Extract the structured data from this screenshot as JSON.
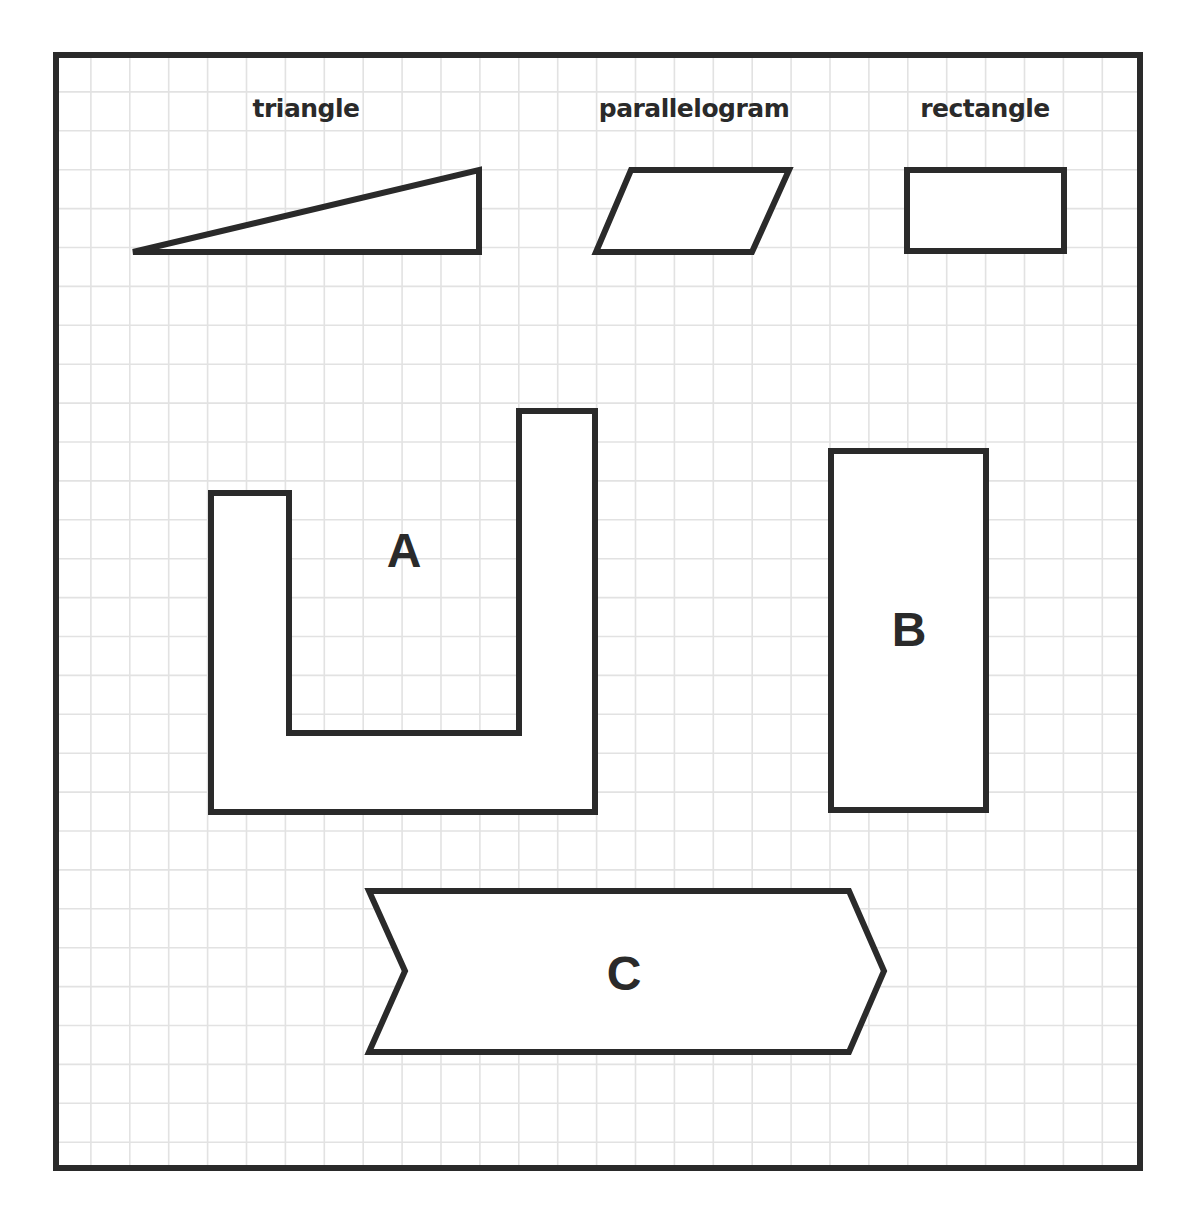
{
  "figure": {
    "colors": {
      "stroke": "#2a2a2a",
      "grid": "#e2e2e2",
      "background": "#ffffff"
    },
    "frame": {
      "x": 56,
      "y": 55,
      "width": 1084,
      "height": 1113
    },
    "grid": {
      "spacing": 38.9,
      "origin_x": 52,
      "origin_y": 53
    },
    "reference_shapes": [
      {
        "name": "triangle",
        "label": "triangle",
        "label_pos": [
          306,
          117
        ],
        "points": "133,252 479,170 479,252"
      },
      {
        "name": "parallelogram",
        "label": "parallelogram",
        "label_pos": [
          694,
          117
        ],
        "points": "631,170 789,170 752,252 596,252"
      },
      {
        "name": "rectangle",
        "label": "rectangle",
        "label_pos": [
          985,
          117
        ],
        "points": "907,170 1064,170 1064,251 907,251"
      }
    ],
    "puzzle_shapes": [
      {
        "name": "shape-a",
        "label": "A",
        "label_pos": [
          404,
          567
        ],
        "points": "211,493 289,493 289,733 519,733 519,411 595,411 595,812 211,812"
      },
      {
        "name": "shape-b",
        "label": "B",
        "label_pos": [
          909,
          646
        ],
        "points": "831,451 986,451 986,810 831,810"
      },
      {
        "name": "shape-c",
        "label": "C",
        "label_pos": [
          624,
          990
        ],
        "points": "369,891 849,891 884,971 849,1052 369,1052 405,971"
      }
    ]
  }
}
